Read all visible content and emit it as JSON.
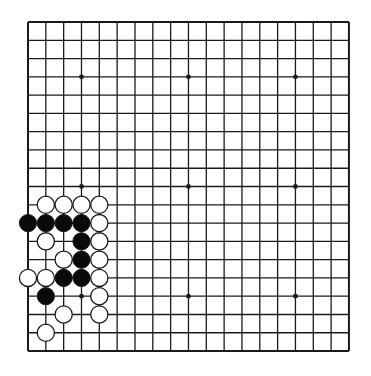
{
  "board": {
    "size": 19,
    "origin": {
      "x": 28,
      "y": 22
    },
    "spacing": {
      "x": 17.83,
      "y": 18.28
    },
    "line_color": "#1a1a1a",
    "background": "#ffffff",
    "star_points": [
      [
        3,
        3
      ],
      [
        3,
        9
      ],
      [
        3,
        15
      ],
      [
        9,
        3
      ],
      [
        9,
        9
      ],
      [
        9,
        15
      ],
      [
        15,
        3
      ],
      [
        15,
        9
      ],
      [
        15,
        15
      ]
    ],
    "stone_radius": 8.6
  },
  "stones": [
    {
      "row": 10,
      "col": 1,
      "color": "white"
    },
    {
      "row": 10,
      "col": 2,
      "color": "white"
    },
    {
      "row": 10,
      "col": 3,
      "color": "white"
    },
    {
      "row": 10,
      "col": 4,
      "color": "white"
    },
    {
      "row": 11,
      "col": 0,
      "color": "black"
    },
    {
      "row": 11,
      "col": 1,
      "color": "black"
    },
    {
      "row": 11,
      "col": 2,
      "color": "black"
    },
    {
      "row": 11,
      "col": 3,
      "color": "black"
    },
    {
      "row": 11,
      "col": 4,
      "color": "white"
    },
    {
      "row": 12,
      "col": 1,
      "color": "white"
    },
    {
      "row": 12,
      "col": 3,
      "color": "black"
    },
    {
      "row": 12,
      "col": 4,
      "color": "white"
    },
    {
      "row": 13,
      "col": 2,
      "color": "white"
    },
    {
      "row": 13,
      "col": 3,
      "color": "black"
    },
    {
      "row": 13,
      "col": 4,
      "color": "white"
    },
    {
      "row": 14,
      "col": 0,
      "color": "white"
    },
    {
      "row": 14,
      "col": 1,
      "color": "white"
    },
    {
      "row": 14,
      "col": 2,
      "color": "black"
    },
    {
      "row": 14,
      "col": 3,
      "color": "black"
    },
    {
      "row": 14,
      "col": 4,
      "color": "white"
    },
    {
      "row": 15,
      "col": 1,
      "color": "black"
    },
    {
      "row": 15,
      "col": 4,
      "color": "white"
    },
    {
      "row": 16,
      "col": 2,
      "color": "white"
    },
    {
      "row": 16,
      "col": 4,
      "color": "white"
    },
    {
      "row": 17,
      "col": 1,
      "color": "white"
    }
  ]
}
